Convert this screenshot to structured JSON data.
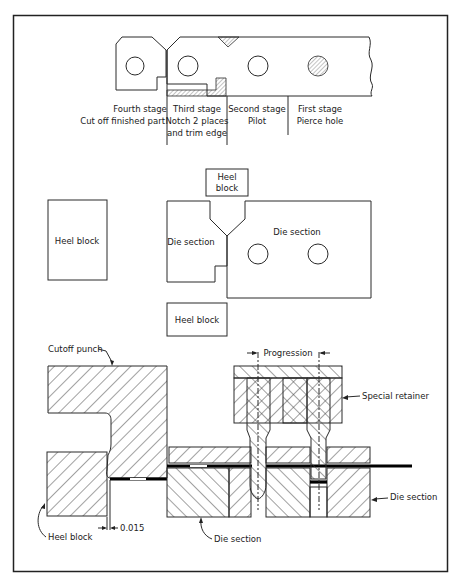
{
  "figure": {
    "strip_layout": {
      "stages": [
        {
          "name": "Fourth stage",
          "operation": "Cut off finished part"
        },
        {
          "name": "Third stage",
          "operation": "Notch 2 places",
          "operation_line2": "and trim edge"
        },
        {
          "name": "Second stage",
          "operation": "Pilot"
        },
        {
          "name": "First stage",
          "operation": "Pierce hole"
        }
      ]
    },
    "plan_view": {
      "heel_block_top": "Heel",
      "heel_block_top_line2": "block",
      "heel_block_left": "Heel block",
      "heel_block_bottom": "Heel block",
      "die_section_left": "Die section",
      "die_section_right": "Die section"
    },
    "section_view": {
      "cutoff_punch": "Cutoff punch",
      "progression": "Progression",
      "special_retainer": "Special retainer",
      "die_section_right": "Die section",
      "die_section_bottom": "Die section",
      "heel_block": "Heel block",
      "clearance": "0.015"
    }
  }
}
